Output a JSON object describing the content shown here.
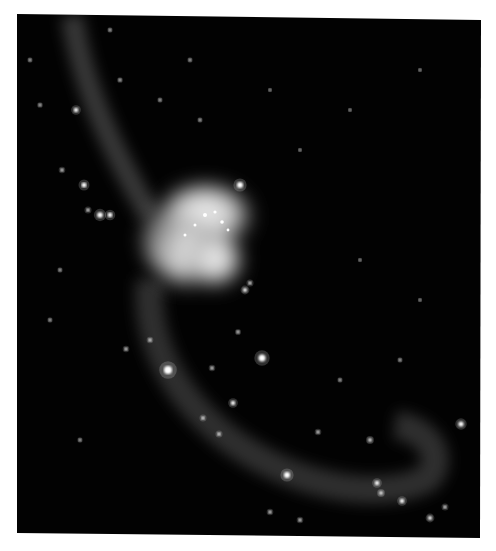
{
  "image": {
    "subject": "Interacting galaxy pair with two long tidal tails",
    "background_color": "#ffffff",
    "sky_color": "#020202",
    "frame": {
      "tl": [
        17,
        14
      ],
      "tr": [
        481,
        20
      ],
      "br": [
        480,
        538
      ],
      "bl": [
        17,
        533
      ]
    },
    "upper_tail": {
      "path": "M72 16 C 80 70, 100 130, 150 215",
      "width": 22,
      "opacity": 0.32
    },
    "lower_tail": {
      "path": "M150 280 C 145 330, 165 390, 230 440 C 300 490, 380 500, 425 480 C 445 465, 435 430, 395 425",
      "width": 28,
      "opacity": 0.3
    },
    "core": {
      "cx": 200,
      "cy": 235,
      "color": "#e8e8e8"
    },
    "stars": [
      [
        76,
        110,
        2.2
      ],
      [
        84,
        185,
        2.5
      ],
      [
        100,
        215,
        2.8
      ],
      [
        110,
        215,
        2.4
      ],
      [
        88,
        210,
        1.6
      ],
      [
        62,
        170,
        1.5
      ],
      [
        40,
        105,
        1.3
      ],
      [
        120,
        80,
        1.3
      ],
      [
        240,
        185,
        3
      ],
      [
        245,
        290,
        2
      ],
      [
        250,
        283,
        1.6
      ],
      [
        168,
        370,
        4
      ],
      [
        262,
        358,
        3.5
      ],
      [
        233,
        403,
        2.2
      ],
      [
        203,
        418,
        1.6
      ],
      [
        219,
        434,
        1.6
      ],
      [
        287,
        475,
        3
      ],
      [
        318,
        432,
        1.5
      ],
      [
        370,
        440,
        1.8
      ],
      [
        377,
        483,
        2.2
      ],
      [
        381,
        493,
        1.8
      ],
      [
        402,
        501,
        2.2
      ],
      [
        461,
        424,
        2.6
      ],
      [
        430,
        518,
        2
      ],
      [
        445,
        507,
        1.6
      ],
      [
        150,
        340,
        1.5
      ],
      [
        126,
        349,
        1.5
      ],
      [
        212,
        368,
        1.5
      ],
      [
        238,
        332,
        1.4
      ],
      [
        270,
        512,
        1.5
      ],
      [
        300,
        520,
        1.5
      ],
      [
        60,
        270,
        1.2
      ],
      [
        50,
        320,
        1.2
      ],
      [
        80,
        440,
        1.2
      ],
      [
        340,
        380,
        1.2
      ],
      [
        400,
        360,
        1.2
      ],
      [
        420,
        300,
        1
      ],
      [
        360,
        260,
        1
      ],
      [
        300,
        150,
        1
      ],
      [
        350,
        110,
        1
      ],
      [
        420,
        70,
        1
      ],
      [
        190,
        60,
        1.2
      ],
      [
        160,
        100,
        1.2
      ],
      [
        200,
        120,
        1.2
      ],
      [
        270,
        90,
        1
      ],
      [
        30,
        60,
        1.2
      ],
      [
        110,
        30,
        1.2
      ]
    ]
  }
}
